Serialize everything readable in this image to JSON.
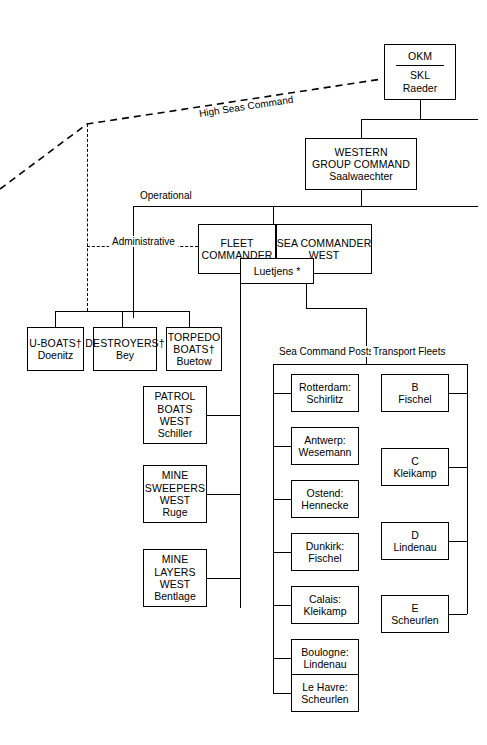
{
  "diagram": {
    "relationship_labels": {
      "high_seas_command": "High Seas Command",
      "operational": "Operational",
      "administrative": "Administrative"
    },
    "column_headers": {
      "sea_command_posts": "Sea Command Posts",
      "transport_fleets": "Transport Fleets"
    },
    "nodes": {
      "okm": {
        "line1": "OKM",
        "line2": "SKL",
        "line3": "Raeder"
      },
      "western_group_command": {
        "line1": "WESTERN",
        "line2": "GROUP COMMAND",
        "line3": "Saalwaechter"
      },
      "fleet_commander": {
        "line1": "FLEET",
        "line2": "COMMANDER"
      },
      "sea_commander_west": {
        "line1": "SEA COMMANDER",
        "line2": "WEST"
      },
      "luetjens": {
        "line1": "Luetjens *"
      }
    },
    "forces": [
      {
        "line1": "U-BOATS†",
        "line2": "Doenitz"
      },
      {
        "line1": "DESTROYERS†",
        "line2": "Bey"
      },
      {
        "line1": "TORPEDO",
        "line2": "BOATS†",
        "line3": "Buetow"
      }
    ],
    "west_units": [
      {
        "line1": "PATROL",
        "line2": "BOATS",
        "line3": "WEST",
        "line4": "Schiller"
      },
      {
        "line1": "MINE",
        "line2": "SWEEPERS",
        "line3": "WEST",
        "line4": "Ruge"
      },
      {
        "line1": "MINE",
        "line2": "LAYERS",
        "line3": "WEST",
        "line4": "Bentlage"
      }
    ],
    "sea_command_posts": [
      {
        "line1": "Rotterdam:",
        "line2": "Schirlitz"
      },
      {
        "line1": "Antwerp:",
        "line2": "Wesemann"
      },
      {
        "line1": "Ostend:",
        "line2": "Hennecke"
      },
      {
        "line1": "Dunkirk:",
        "line2": "Fischel"
      },
      {
        "line1": "Calais:",
        "line2": "Kleikamp"
      },
      {
        "line1": "Boulogne:",
        "line2": "Lindenau"
      },
      {
        "line1": "Le Havre:",
        "line2": "Scheurlen"
      }
    ],
    "transport_fleets": [
      {
        "line1": "B",
        "line2": "Fischel"
      },
      {
        "line1": "C",
        "line2": "Kleikamp"
      },
      {
        "line1": "D",
        "line2": "Lindenau"
      },
      {
        "line1": "E",
        "line2": "Scheurlen"
      }
    ],
    "colors": {
      "line": "#000000",
      "background": "#ffffff",
      "text": "#000000"
    }
  }
}
